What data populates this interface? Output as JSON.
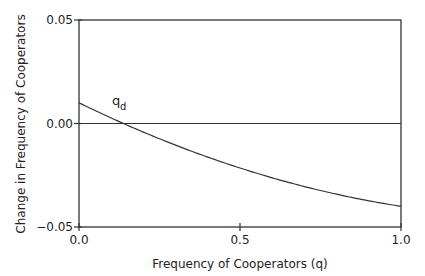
{
  "chart_data": {
    "type": "line",
    "title": "",
    "xlabel": "Frequency of Cooperators (q)",
    "ylabel": "Change in Frequency of Cooperators",
    "xlim": [
      0.0,
      1.0
    ],
    "ylim": [
      -0.05,
      0.05
    ],
    "xticks": [
      0.0,
      0.5,
      1.0
    ],
    "xtick_labels": [
      "0.0",
      "0.5",
      "1.0"
    ],
    "yticks": [
      -0.05,
      0.0,
      0.05
    ],
    "ytick_labels": [
      "−0.05",
      "0.00",
      "0.05"
    ],
    "grid": false,
    "legend": null,
    "reference_lines": [
      {
        "orientation": "horizontal",
        "y": 0.0
      }
    ],
    "series": [
      {
        "name": "delta_q",
        "x": [
          0.0,
          0.1,
          0.11,
          0.2,
          0.3,
          0.4,
          0.5,
          0.6,
          0.7,
          0.8,
          0.9,
          1.0
        ],
        "y": [
          0.01,
          0.0027,
          0.0,
          -0.0042,
          -0.0105,
          -0.0162,
          -0.0215,
          -0.0262,
          -0.0305,
          -0.0342,
          -0.0373,
          -0.04
        ]
      }
    ],
    "annotations": [
      {
        "text": "q",
        "subscript": "d",
        "x": 0.11,
        "y": 0.0,
        "meaning": "equilibrium frequency where curve crosses zero"
      }
    ],
    "colors": {
      "line": "#333333",
      "frame": "#333333",
      "text": "#222222"
    }
  }
}
